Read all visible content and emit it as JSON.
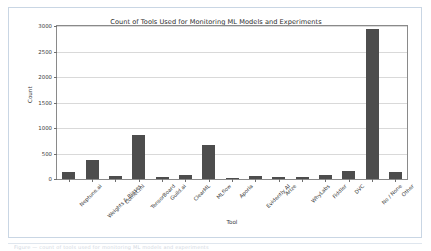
{
  "page": {
    "caption_text": "Figure — count of tools used for monitoring ML models and experiments"
  },
  "chart_data": {
    "type": "bar",
    "title": "Count of Tools Used for Monitoring ML Models and Experiments",
    "xlabel": "Tool",
    "ylabel": "Count",
    "ylim": [
      0,
      3000
    ],
    "yticks": [
      0,
      500,
      1000,
      1500,
      2000,
      2500,
      3000
    ],
    "ytick_labels": [
      "0",
      "500",
      "1000",
      "1500",
      "2000",
      "2500",
      "3000"
    ],
    "grid": "horizontal",
    "legend": "none",
    "bar_color": "#4d4d4d",
    "categories": [
      "Neptune.ai",
      "Weights & Biases",
      "Comet.ml",
      "TensorBoard",
      "Guild.ai",
      "ClearML",
      "MLflow",
      "Aporia",
      "Evidently AI",
      "Arize",
      "WhyLabs",
      "Fiddler",
      "DVC",
      "No / None",
      "Other"
    ],
    "values": [
      130,
      375,
      55,
      860,
      35,
      80,
      660,
      25,
      55,
      40,
      30,
      80,
      160,
      2950,
      145
    ]
  }
}
